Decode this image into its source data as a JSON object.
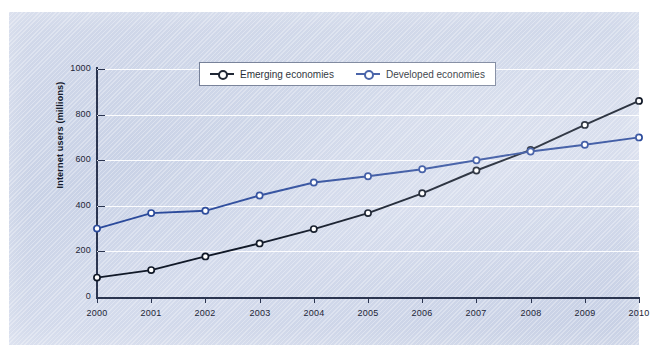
{
  "chart_data": {
    "type": "line",
    "title": "",
    "xlabel": "",
    "ylabel": "Internet users (millions)",
    "categories": [
      "2000",
      "2001",
      "2002",
      "2003",
      "2004",
      "2005",
      "2006",
      "2007",
      "2008",
      "2009",
      "2010"
    ],
    "ylim": [
      0,
      1000
    ],
    "yticks": [
      0,
      200,
      400,
      600,
      800,
      1000
    ],
    "ytick_labels": [
      "0",
      "200",
      "400",
      "600",
      "800",
      "1000"
    ],
    "grid": "horizontal",
    "legend_position": "top-center",
    "series": [
      {
        "name": "Emerging economies",
        "color": "#101827",
        "marker": "open-circle",
        "values": [
          85,
          118,
          178,
          235,
          298,
          368,
          455,
          555,
          645,
          755,
          860
        ]
      },
      {
        "name": "Developed economies",
        "color": "#2b4a9b",
        "marker": "open-circle",
        "values": [
          300,
          368,
          378,
          445,
          502,
          530,
          560,
          600,
          638,
          668,
          700
        ]
      }
    ]
  },
  "colors": {
    "panel_background": "#ccd5e8",
    "gridline": "#ffffff",
    "axis": "#2b3550",
    "emerging": "#101827",
    "developed": "#2b4a9b",
    "legend_background": "#ffffff",
    "legend_border": "#6f7a93",
    "text": "#1d2537"
  }
}
